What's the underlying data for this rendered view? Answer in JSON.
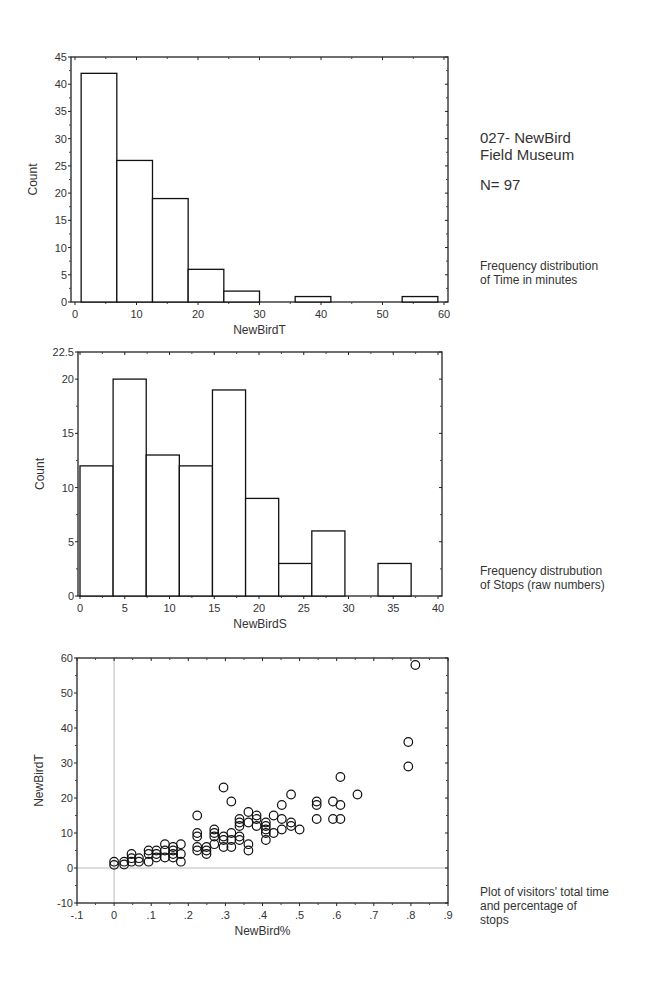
{
  "header": {
    "title_line1": "027- NewBird",
    "title_line2": "Field Museum",
    "sample_size": "N= 97"
  },
  "captions": {
    "chart1_line1": "Frequency distribution",
    "chart1_line2": "of Time in minutes",
    "chart2_line1": "Frequency distrubution",
    "chart2_line2": "of Stops (raw numbers)",
    "chart3_line1": "Plot of visitors' total time",
    "chart3_line2": "and percentage of",
    "chart3_line3": "stops"
  },
  "chart_data": [
    {
      "type": "bar",
      "subtype": "histogram",
      "title": "",
      "xlabel": "NewBirdT",
      "ylabel": "Count",
      "xlim": [
        0,
        60
      ],
      "ylim": [
        0,
        45
      ],
      "x_ticks": [
        0,
        10,
        20,
        30,
        40,
        50,
        60
      ],
      "y_ticks": [
        0,
        5,
        10,
        15,
        20,
        25,
        30,
        35,
        40,
        45
      ],
      "bin_edges": [
        1,
        6.8,
        12.6,
        18.4,
        24.2,
        30,
        35.8,
        41.6,
        47.4,
        53.2,
        59
      ],
      "values": [
        42,
        26,
        19,
        6,
        2,
        0,
        1,
        0,
        0,
        1
      ],
      "grid": false
    },
    {
      "type": "bar",
      "subtype": "histogram",
      "title": "",
      "xlabel": "NewBirdS",
      "ylabel": "Count",
      "xlim": [
        0,
        40
      ],
      "ylim": [
        0,
        22.5
      ],
      "x_ticks": [
        0,
        5,
        10,
        15,
        20,
        25,
        30,
        35,
        40
      ],
      "y_ticks": [
        0,
        5,
        10,
        15,
        20,
        22.5
      ],
      "bin_edges": [
        0,
        3.7,
        7.4,
        11.1,
        14.8,
        18.5,
        22.2,
        25.9,
        29.6,
        33.3,
        37
      ],
      "values": [
        12,
        20,
        13,
        12,
        19,
        9,
        3,
        6,
        0,
        3
      ],
      "grid": false
    },
    {
      "type": "scatter",
      "title": "",
      "xlabel": "NewBird%",
      "ylabel": "NewBirdT",
      "xlim": [
        -0.1,
        0.9
      ],
      "ylim": [
        -10,
        60
      ],
      "x_ticks": [
        "-.1",
        "0",
        ".1",
        ".2",
        ".3",
        ".4",
        ".5",
        ".6",
        ".7",
        ".8",
        ".9"
      ],
      "y_ticks": [
        -10,
        0,
        10,
        20,
        30,
        40,
        50,
        60
      ],
      "reference_lines": {
        "x": 0,
        "y": 0
      },
      "marker": "open-circle",
      "points": [
        [
          0,
          1.8
        ],
        [
          0,
          0.9
        ],
        [
          0.027,
          1.8
        ],
        [
          0.027,
          1
        ],
        [
          0.047,
          4
        ],
        [
          0.047,
          2.8
        ],
        [
          0.047,
          1.8
        ],
        [
          0.067,
          2.8
        ],
        [
          0.067,
          1.8
        ],
        [
          0.093,
          5
        ],
        [
          0.093,
          4
        ],
        [
          0.093,
          1.8
        ],
        [
          0.114,
          5
        ],
        [
          0.114,
          4
        ],
        [
          0.114,
          3
        ],
        [
          0.137,
          6.8
        ],
        [
          0.137,
          5
        ],
        [
          0.137,
          3
        ],
        [
          0.159,
          6
        ],
        [
          0.159,
          5
        ],
        [
          0.159,
          4
        ],
        [
          0.159,
          3
        ],
        [
          0.18,
          6.8
        ],
        [
          0.18,
          4
        ],
        [
          0.18,
          1.8
        ],
        [
          0.224,
          15
        ],
        [
          0.224,
          10
        ],
        [
          0.224,
          9
        ],
        [
          0.224,
          6
        ],
        [
          0.224,
          5
        ],
        [
          0.249,
          6
        ],
        [
          0.249,
          5
        ],
        [
          0.249,
          4
        ],
        [
          0.27,
          11
        ],
        [
          0.27,
          10
        ],
        [
          0.27,
          9
        ],
        [
          0.27,
          6.8
        ],
        [
          0.295,
          23
        ],
        [
          0.295,
          9
        ],
        [
          0.295,
          8
        ],
        [
          0.295,
          6
        ],
        [
          0.316,
          19
        ],
        [
          0.316,
          10
        ],
        [
          0.316,
          8
        ],
        [
          0.316,
          6
        ],
        [
          0.338,
          14
        ],
        [
          0.338,
          13
        ],
        [
          0.338,
          12
        ],
        [
          0.338,
          9
        ],
        [
          0.338,
          8
        ],
        [
          0.362,
          16
        ],
        [
          0.362,
          13
        ],
        [
          0.362,
          6.8
        ],
        [
          0.362,
          5
        ],
        [
          0.384,
          15
        ],
        [
          0.384,
          14
        ],
        [
          0.384,
          12
        ],
        [
          0.409,
          13
        ],
        [
          0.409,
          12
        ],
        [
          0.409,
          11
        ],
        [
          0.409,
          10
        ],
        [
          0.409,
          8
        ],
        [
          0.43,
          15
        ],
        [
          0.43,
          10
        ],
        [
          0.452,
          18
        ],
        [
          0.452,
          14
        ],
        [
          0.452,
          11
        ],
        [
          0.477,
          21
        ],
        [
          0.477,
          13
        ],
        [
          0.477,
          12
        ],
        [
          0.5,
          11
        ],
        [
          0.546,
          19
        ],
        [
          0.546,
          18
        ],
        [
          0.546,
          14
        ],
        [
          0.59,
          19
        ],
        [
          0.59,
          14
        ],
        [
          0.61,
          26
        ],
        [
          0.61,
          18
        ],
        [
          0.61,
          14
        ],
        [
          0.656,
          21
        ],
        [
          0.793,
          36
        ],
        [
          0.793,
          29
        ],
        [
          0.812,
          58
        ]
      ],
      "grid": false
    }
  ]
}
